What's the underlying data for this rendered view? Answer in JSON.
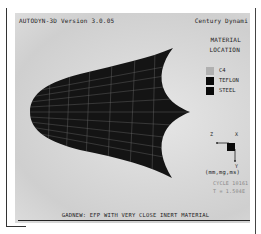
{
  "window": {
    "app_title": "AUTODYN-3D Version 3.0.05",
    "vendor": "Century Dynami"
  },
  "legend": {
    "heading_line1": "MATERIAL",
    "heading_line2": "LOCATION",
    "items": [
      {
        "label": "C4",
        "color": "#b0b0b0"
      },
      {
        "label": "TEFLON",
        "color": "#0a0a0a"
      },
      {
        "label": "STEEL",
        "color": "#0a0a0a"
      }
    ]
  },
  "axes": {
    "z_label": "Z",
    "x_label": "X",
    "y_label": "Y",
    "units": "(mm,mg,ms)"
  },
  "status": {
    "cycle": "CYCLE 10161",
    "time": "T = 1.504E"
  },
  "caption": "GADNEW: EFP WITH VERY CLOSE INERT MATERIAL",
  "colors": {
    "background": "#d8d8d8",
    "projectile": "#151515",
    "mesh": "#9a9a9a"
  }
}
